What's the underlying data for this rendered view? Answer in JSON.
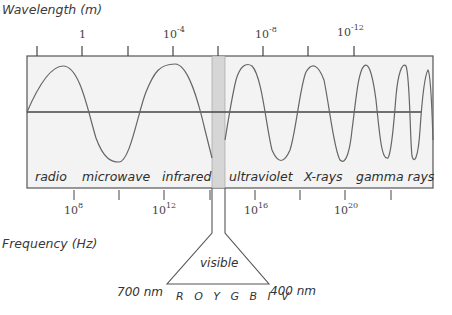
{
  "diagram": {
    "wavelength_axis": {
      "title": "Wavelength (m)",
      "tick_labels": [
        {
          "base": "1",
          "exp": ""
        },
        {
          "base": "10",
          "exp": "-4"
        },
        {
          "base": "10",
          "exp": "-8"
        },
        {
          "base": "10",
          "exp": "-12"
        }
      ]
    },
    "frequency_axis": {
      "title": "Frequency (Hz)",
      "tick_labels": [
        {
          "base": "10",
          "exp": "8"
        },
        {
          "base": "10",
          "exp": "12"
        },
        {
          "base": "10",
          "exp": "16"
        },
        {
          "base": "10",
          "exp": "20"
        }
      ]
    },
    "bands": [
      {
        "label": "radio"
      },
      {
        "label": "microwave"
      },
      {
        "label": "infrared"
      },
      {
        "label": "ultraviolet"
      },
      {
        "label": "X-rays"
      },
      {
        "label": "gamma rays"
      }
    ],
    "visible": {
      "label": "visible",
      "long_end": "700 nm",
      "short_end": "400 nm",
      "colors": "R O Y G B I V"
    },
    "colors": {
      "box_fill": "#f3f3f3",
      "box_border": "#555555",
      "visible_band": "#d6d6d6",
      "wave_line": "#666666",
      "axis_line": "#444444"
    }
  }
}
